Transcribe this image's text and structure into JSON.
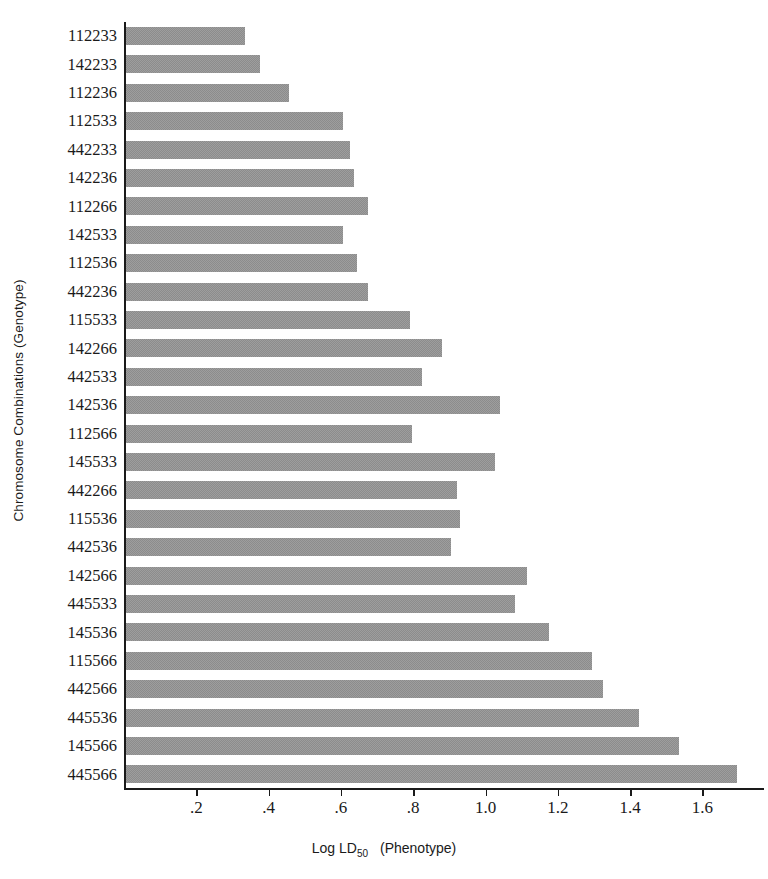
{
  "chart_data": {
    "type": "bar",
    "orientation": "horizontal",
    "title": "",
    "xlabel": "Log LD50   (Phenotype)",
    "xlabel_parts": {
      "pre": "Log LD",
      "sub": "50",
      "post": "(Phenotype)"
    },
    "ylabel": "Chromosome Combinations (Genotype)",
    "xlim": [
      0,
      1.77
    ],
    "grid": false,
    "legend": null,
    "bar_color": "#8c8c8c",
    "axis_color": "#1a1a1a",
    "background_color": "#ffffff",
    "xticks": [
      0.2,
      0.4,
      0.6,
      0.8,
      1.0,
      1.2,
      1.4,
      1.6
    ],
    "xtick_labels": [
      ".2",
      ".4",
      ".6",
      ".8",
      "1.0",
      "1.2",
      "1.4",
      "1.6"
    ],
    "categories": [
      "112233",
      "142233",
      "112236",
      "112533",
      "442233",
      "142236",
      "112266",
      "142533",
      "112536",
      "442236",
      "115533",
      "142266",
      "442533",
      "142536",
      "112566",
      "145533",
      "442266",
      "115536",
      "442536",
      "142566",
      "445533",
      "145536",
      "115566",
      "442566",
      "445536",
      "145566",
      "445566"
    ],
    "values": [
      0.33,
      0.37,
      0.45,
      0.6,
      0.62,
      0.63,
      0.67,
      0.6,
      0.64,
      0.67,
      0.785,
      0.875,
      0.82,
      1.035,
      0.79,
      1.02,
      0.915,
      0.925,
      0.9,
      1.11,
      1.075,
      1.17,
      1.29,
      1.32,
      1.42,
      1.53,
      1.69
    ]
  }
}
